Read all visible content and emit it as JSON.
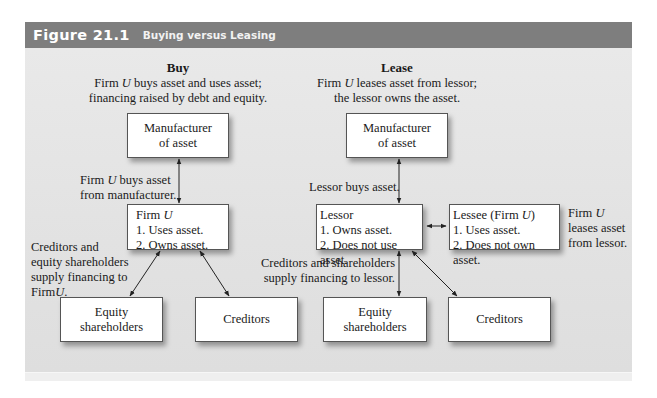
{
  "figure": {
    "number": "Figure 21.1",
    "title": "Buying versus Leasing"
  },
  "buy": {
    "heading": "Buy",
    "description_line1": "Firm U buys asset and uses asset;",
    "description_line2": "financing raised by debt and equity.",
    "manufacturer_box": {
      "line1": "Manufacturer",
      "line2": "of asset"
    },
    "purchase_label_line1": "Firm U buys asset",
    "purchase_label_line2": "from manufacturer.",
    "firm_box": {
      "title": "Firm U",
      "item1": "1. Uses asset.",
      "item2": "2. Owns asset."
    },
    "financing_label": [
      "Creditors and",
      "equity shareholders",
      "supply financing to",
      "FirmU."
    ],
    "equity_box": {
      "line1": "Equity",
      "line2": "shareholders"
    },
    "creditors_box": {
      "line1": "Creditors"
    }
  },
  "lease": {
    "heading": "Lease",
    "description_line1": "Firm U leases asset from lessor;",
    "description_line2": "the lessor owns the asset.",
    "manufacturer_box": {
      "line1": "Manufacturer",
      "line2": "of asset"
    },
    "purchase_label": "Lessor buys asset.",
    "lessor_box": {
      "title": "Lessor",
      "item1": "1. Owns asset.",
      "item2": "2. Does not use asset."
    },
    "lessee_box": {
      "title": "Lessee (Firm U)",
      "item1": "1. Uses asset.",
      "item2": "2. Does not own asset."
    },
    "lease_label": [
      "Firm U",
      "leases asset",
      "from lessor."
    ],
    "financing_label_line1": "Creditors and shareholders",
    "financing_label_line2": "supply financing to lessor.",
    "equity_box": {
      "line1": "Equity",
      "line2": "shareholders"
    },
    "creditors_box": {
      "line1": "Creditors"
    }
  },
  "colors": {
    "header_bg": "#7e7e7e",
    "panel_bg": "#e5e5e5",
    "box_bg": "#ffffff",
    "arrow": "#222222"
  }
}
